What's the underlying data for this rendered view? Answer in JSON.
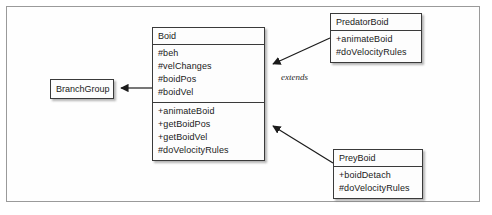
{
  "diagram": {
    "background_color": "#ffffff",
    "frame_border_color": "#9a9a9a",
    "box_border_color": "#3a3a3a",
    "box_fill_color": "#fdfdfd",
    "line_color": "#1b1b1b"
  },
  "classes": {
    "boid": {
      "name": "Boid",
      "attributes": [
        "#beh",
        "#velChanges",
        "#boidPos",
        "#boidVel"
      ],
      "operations": [
        "+animateBoid",
        "+getBoidPos",
        "+getBoidVel",
        "#doVelocityRules"
      ]
    },
    "branch_group": {
      "name": "BranchGroup"
    },
    "predator_boid": {
      "name": "PredatorBoid",
      "operations": [
        "+animateBoid",
        "#doVelocityRules"
      ]
    },
    "prey_boid": {
      "name": "PreyBoid",
      "operations": [
        "+boidDetach",
        "#doVelocityRules"
      ]
    }
  },
  "relationships": [
    {
      "id": "boid-to-branchgroup",
      "from": "Boid",
      "to": "BranchGroup",
      "label": "",
      "arrow": "solid-filled"
    },
    {
      "id": "predatorboid-to-boid",
      "from": "PredatorBoid",
      "to": "Boid",
      "label": "extends",
      "arrow": "solid-filled"
    },
    {
      "id": "preyboid-to-boid",
      "from": "PreyBoid",
      "to": "Boid",
      "label": "",
      "arrow": "solid-filled"
    }
  ],
  "labels": {
    "extends": "extends"
  }
}
